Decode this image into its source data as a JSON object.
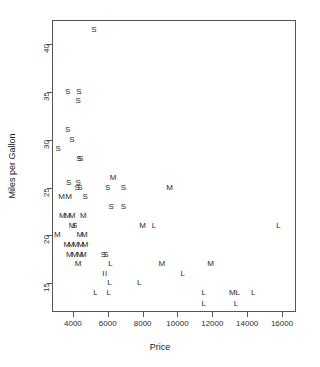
{
  "chart_data": {
    "type": "scatter",
    "title": "",
    "xlabel": "Price",
    "ylabel": "Miles per Gallon",
    "xlim": [
      2800,
      16800
    ],
    "ylim": [
      12.0,
      42.5
    ],
    "grid": false,
    "legend": "none",
    "marker_style": "text-letter",
    "xticks": [
      4000,
      6000,
      8000,
      10000,
      12000,
      14000,
      16000
    ],
    "xticklabels": [
      "4000",
      "6000",
      "8000",
      "10000",
      "12000",
      "14000",
      "16000"
    ],
    "yticks": [
      40,
      35,
      30,
      25,
      20,
      15
    ],
    "yticklabels": [
      "40",
      "35",
      "30",
      "25",
      "20",
      "15"
    ],
    "series": [
      {
        "name": "S",
        "label": "S",
        "points": [
          {
            "x": 5200,
            "y": 41.5
          },
          {
            "x": 3700,
            "y": 35.0
          },
          {
            "x": 4350,
            "y": 35.0
          },
          {
            "x": 4300,
            "y": 34.0
          },
          {
            "x": 3700,
            "y": 31.0
          },
          {
            "x": 3950,
            "y": 30.0
          },
          {
            "x": 3150,
            "y": 29.0
          },
          {
            "x": 4350,
            "y": 28.0
          },
          {
            "x": 4450,
            "y": 28.0
          },
          {
            "x": 3750,
            "y": 25.5
          },
          {
            "x": 4300,
            "y": 25.5
          },
          {
            "x": 6000,
            "y": 25.0
          },
          {
            "x": 6900,
            "y": 25.0
          },
          {
            "x": 4250,
            "y": 25.0
          },
          {
            "x": 4400,
            "y": 25.0
          },
          {
            "x": 4700,
            "y": 24.0
          },
          {
            "x": 6200,
            "y": 23.0
          },
          {
            "x": 6900,
            "y": 23.0
          },
          {
            "x": 4100,
            "y": 21.0
          },
          {
            "x": 5750,
            "y": 18.0
          },
          {
            "x": 5900,
            "y": 18.0
          }
        ]
      },
      {
        "name": "M",
        "label": "M",
        "points": [
          {
            "x": 6300,
            "y": 26.0
          },
          {
            "x": 9550,
            "y": 25.0
          },
          {
            "x": 3350,
            "y": 24.0
          },
          {
            "x": 3750,
            "y": 24.0
          },
          {
            "x": 3400,
            "y": 22.0
          },
          {
            "x": 3700,
            "y": 22.0
          },
          {
            "x": 3950,
            "y": 22.0
          },
          {
            "x": 4600,
            "y": 22.0
          },
          {
            "x": 3950,
            "y": 21.0
          },
          {
            "x": 8000,
            "y": 21.0
          },
          {
            "x": 3100,
            "y": 20.0
          },
          {
            "x": 4400,
            "y": 20.0
          },
          {
            "x": 4650,
            "y": 20.0
          },
          {
            "x": 3650,
            "y": 19.0
          },
          {
            "x": 3900,
            "y": 19.0
          },
          {
            "x": 4150,
            "y": 19.0
          },
          {
            "x": 4450,
            "y": 19.0
          },
          {
            "x": 4700,
            "y": 19.0
          },
          {
            "x": 3800,
            "y": 18.0
          },
          {
            "x": 4100,
            "y": 18.0
          },
          {
            "x": 4400,
            "y": 18.0
          },
          {
            "x": 4600,
            "y": 18.0
          },
          {
            "x": 4300,
            "y": 17.0
          },
          {
            "x": 9100,
            "y": 17.0
          },
          {
            "x": 11900,
            "y": 17.0
          },
          {
            "x": 13150,
            "y": 14.0
          }
        ]
      },
      {
        "name": "L",
        "label": "L",
        "points": [
          {
            "x": 8650,
            "y": 21.0
          },
          {
            "x": 15800,
            "y": 21.0
          },
          {
            "x": 6150,
            "y": 17.0
          },
          {
            "x": 10300,
            "y": 16.0
          },
          {
            "x": 6100,
            "y": 15.0
          },
          {
            "x": 7800,
            "y": 15.0
          },
          {
            "x": 5300,
            "y": 14.0
          },
          {
            "x": 6050,
            "y": 14.0
          },
          {
            "x": 11500,
            "y": 14.0
          },
          {
            "x": 13450,
            "y": 14.0
          },
          {
            "x": 14350,
            "y": 14.0
          },
          {
            "x": 11500,
            "y": 12.8
          },
          {
            "x": 13350,
            "y": 12.8
          }
        ]
      },
      {
        "name": "I",
        "label": "I",
        "points": [
          {
            "x": 5750,
            "y": 16.0
          },
          {
            "x": 5900,
            "y": 16.0
          }
        ]
      }
    ]
  }
}
